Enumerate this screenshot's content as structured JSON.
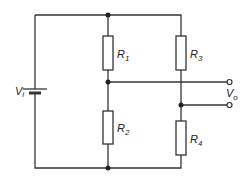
{
  "diagram": {
    "type": "Wheatstone bridge circuit",
    "colors": {
      "wire": "#333333",
      "background": "#ffffff"
    },
    "source": {
      "symbol": "V",
      "subscript": "i",
      "icon": "battery-icon"
    },
    "output": {
      "symbol": "V",
      "subscript": "o",
      "terminals": 2
    },
    "resistors": [
      {
        "symbol": "R",
        "subscript": "1",
        "branch": "left",
        "position": "top"
      },
      {
        "symbol": "R",
        "subscript": "2",
        "branch": "left",
        "position": "bottom"
      },
      {
        "symbol": "R",
        "subscript": "3",
        "branch": "right",
        "position": "top"
      },
      {
        "symbol": "R",
        "subscript": "4",
        "branch": "right",
        "position": "bottom"
      }
    ]
  }
}
